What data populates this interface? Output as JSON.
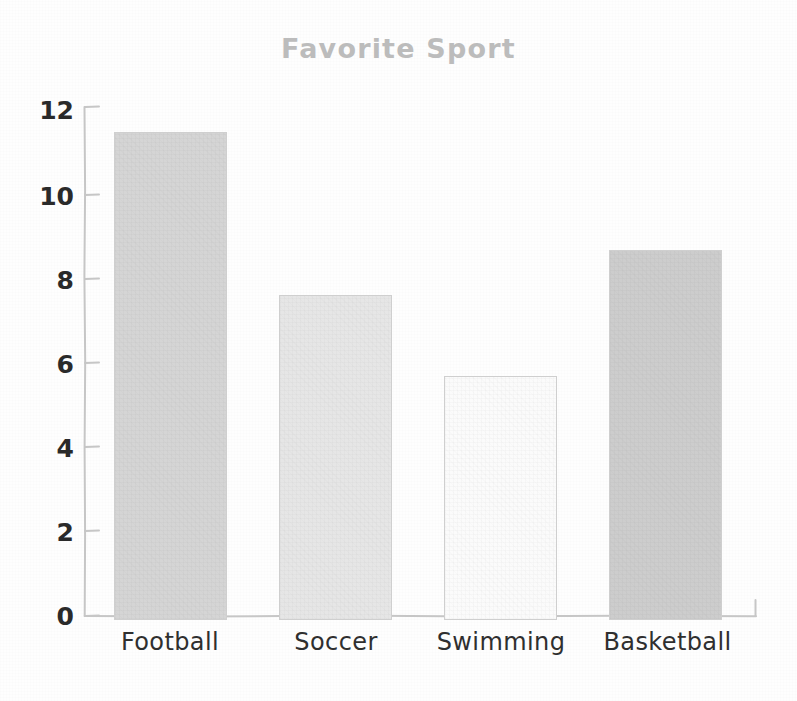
{
  "chart_data": {
    "type": "bar",
    "title": "Favorite Sport",
    "xlabel": "",
    "ylabel": "",
    "categories": [
      "Football",
      "Soccer",
      "Swimming",
      "Basketball"
    ],
    "values": [
      12,
      8,
      6,
      9.1
    ],
    "yticks": [
      0,
      2,
      4,
      6,
      8,
      10,
      12
    ],
    "ylim": [
      0,
      12.6
    ],
    "grid": false,
    "legend": false,
    "style": "hand-drawn-sketch",
    "bar_colors": [
      "#d5d5d5",
      "#e6e6e6",
      "#fbfbfb",
      "#cdcdcd"
    ],
    "bar_edge_color": "#cfcfcf",
    "title_color": "#bcbcbc",
    "axis_color": "#c6c6c6",
    "tick_label_color": "#2a2a2a",
    "background_color": "#fefefe"
  }
}
